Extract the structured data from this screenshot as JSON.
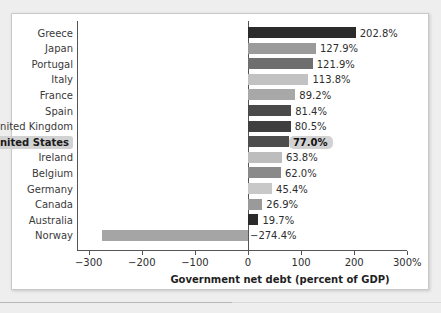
{
  "chart_data": {
    "type": "bar",
    "orientation": "horizontal",
    "title": "",
    "xlabel": "Government net debt (percent of GDP)",
    "ylabel": "",
    "xlim": [
      -300,
      300
    ],
    "grid": false,
    "legend": null,
    "categories": [
      "Greece",
      "Japan",
      "Portugal",
      "Italy",
      "France",
      "Spain",
      "United Kingdom",
      "United States",
      "Ireland",
      "Belgium",
      "Germany",
      "Canada",
      "Australia",
      "Norway"
    ],
    "values": [
      202.8,
      127.9,
      121.9,
      113.8,
      89.2,
      81.4,
      80.5,
      77.0,
      63.8,
      62.0,
      45.4,
      26.9,
      19.7,
      -274.4
    ],
    "data_labels": [
      "202.8%",
      "127.9%",
      "121.9%",
      "113.8%",
      "89.2%",
      "81.4%",
      "80.5%",
      "77.0%",
      "63.8%",
      "62.0%",
      "45.4%",
      "26.9%",
      "19.7%",
      "−274.4%"
    ],
    "bar_colors": [
      "#2b2b2b",
      "#9b9b9b",
      "#6f6f6f",
      "#c2c2c2",
      "#a8a8a8",
      "#4a4a4a",
      "#3f3f3f",
      "#4d4d4d",
      "#bdbdbd",
      "#8a8a8a",
      "#c8c8c8",
      "#9a9a9a",
      "#2a2a2a",
      "#a5a5a5"
    ],
    "highlight_category": "United States",
    "highlight_color": "#d2d2d2",
    "xticks": [
      -300,
      -200,
      -100,
      0,
      100,
      200,
      300
    ],
    "xtick_labels": [
      "−300",
      "−200",
      "−100",
      "0",
      "100",
      "200",
      "300%"
    ]
  }
}
